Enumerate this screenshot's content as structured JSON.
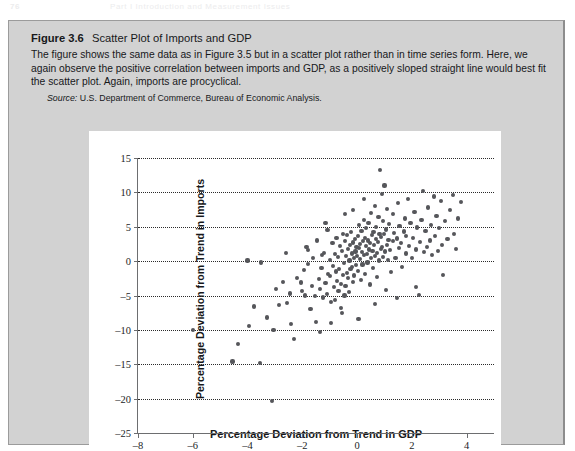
{
  "page_header": {
    "folio": "76",
    "running_head": "Part I  Introduction and Measurement Issues"
  },
  "figure": {
    "label": "Figure 3.6",
    "title": "Scatter Plot of Imports and GDP",
    "description": "The figure shows the same data as in Figure 3.5 but in a scatter plot rather than in time series form. Here, we again observe the positive correlation between imports and GDP, as a positively sloped straight line would best fit the scatter plot. Again, imports are procyclical.",
    "source_label": "Source:",
    "source_text": "U.S. Department of Commerce, Bureau of Economic Analysis."
  },
  "colors": {
    "card_background": "#d2d2d2",
    "card_border": "#9b9b9b",
    "plot_background": "#ffffff",
    "marker": "#55565a",
    "axis": "#6d6e70",
    "gridline": "#2b2b2b",
    "text": "#17181a"
  },
  "chart_data": {
    "type": "scatter",
    "title": "Scatter Plot of Imports and GDP",
    "subtitle": "",
    "xlabel": "Percentage Deviation from Trend in GDP",
    "ylabel": "Percentage Deviation from Trend in Imports",
    "xlim": [
      -8,
      5
    ],
    "ylim": [
      -25,
      15
    ],
    "xticks": [
      -8,
      -6,
      -4,
      -2,
      0,
      2,
      4
    ],
    "xtick_labels": [
      "–8",
      "–6",
      "–4",
      "–2",
      "0",
      "2",
      "4"
    ],
    "yticks": [
      15,
      10,
      5,
      0,
      -5,
      -10,
      -15,
      -20,
      -25
    ],
    "ytick_labels": [
      "15",
      "10",
      "5",
      "0",
      "–5",
      "–10",
      "–15",
      "–20",
      "–25"
    ],
    "grid": "horizontal-dotted",
    "legend": null,
    "marker_size": 4,
    "correlation": "positive",
    "points": [
      [
        -6.0,
        -10.0
      ],
      [
        -4.55,
        -14.6
      ],
      [
        -4.35,
        -12.1
      ],
      [
        -3.95,
        -9.4
      ],
      [
        -3.55,
        -14.8
      ],
      [
        -3.5,
        -0.2
      ],
      [
        -3.1,
        -20.4
      ],
      [
        -3.05,
        -10.0
      ],
      [
        -2.85,
        -6.4
      ],
      [
        -2.55,
        -6.1
      ],
      [
        -2.45,
        -4.7
      ],
      [
        -2.4,
        -9.1
      ],
      [
        -2.3,
        -11.3
      ],
      [
        -2.05,
        -3.1
      ],
      [
        -2.0,
        -4.4
      ],
      [
        -1.95,
        -1.3
      ],
      [
        -1.9,
        -5.0
      ],
      [
        -1.85,
        2.1
      ],
      [
        -1.8,
        -0.4
      ],
      [
        -1.78,
        1.6
      ],
      [
        -1.7,
        -7.0
      ],
      [
        -1.65,
        -3.6
      ],
      [
        -1.6,
        0.4
      ],
      [
        -1.55,
        -5.1
      ],
      [
        -1.5,
        -8.8
      ],
      [
        -1.45,
        3.0
      ],
      [
        -1.4,
        -2.6
      ],
      [
        -1.35,
        -4.1
      ],
      [
        -1.3,
        -1.0
      ],
      [
        -1.28,
        0.9
      ],
      [
        -1.25,
        -5.3
      ],
      [
        -1.2,
        1.2
      ],
      [
        -1.15,
        -3.2
      ],
      [
        -1.1,
        -4.8
      ],
      [
        -1.08,
        4.5
      ],
      [
        -1.05,
        -1.9
      ],
      [
        -1.0,
        0.2
      ],
      [
        -0.98,
        -2.2
      ],
      [
        -0.95,
        -6.0
      ],
      [
        -0.9,
        2.6
      ],
      [
        -0.88,
        -0.7
      ],
      [
        -0.85,
        -3.8
      ],
      [
        -0.82,
        1.0
      ],
      [
        -0.8,
        -5.6
      ],
      [
        -0.78,
        -1.5
      ],
      [
        -0.75,
        3.4
      ],
      [
        -0.72,
        -2.9
      ],
      [
        -0.7,
        0.6
      ],
      [
        -0.68,
        -4.3
      ],
      [
        -0.65,
        -1.1
      ],
      [
        -0.62,
        2.2
      ],
      [
        -0.6,
        -3.3
      ],
      [
        -0.58,
        -6.8
      ],
      [
        -0.55,
        1.5
      ],
      [
        -0.52,
        -2.0
      ],
      [
        -0.5,
        4.0
      ],
      [
        -0.48,
        -0.3
      ],
      [
        -0.46,
        -5.0
      ],
      [
        -0.44,
        2.9
      ],
      [
        -0.42,
        -3.6
      ],
      [
        -0.4,
        0.8
      ],
      [
        -0.38,
        -1.7
      ],
      [
        -0.36,
        3.8
      ],
      [
        -0.34,
        -2.4
      ],
      [
        -0.32,
        1.8
      ],
      [
        -0.3,
        -4.5
      ],
      [
        -0.28,
        0.1
      ],
      [
        -0.26,
        2.4
      ],
      [
        -0.24,
        -1.2
      ],
      [
        -0.22,
        4.2
      ],
      [
        -0.2,
        -0.9
      ],
      [
        -0.18,
        1.1
      ],
      [
        -0.16,
        -3.0
      ],
      [
        -0.14,
        2.7
      ],
      [
        -0.12,
        0.4
      ],
      [
        -0.1,
        -2.1
      ],
      [
        -0.08,
        3.2
      ],
      [
        -0.06,
        1.4
      ],
      [
        -0.04,
        -0.6
      ],
      [
        -0.02,
        2.0
      ],
      [
        0.0,
        0.7
      ],
      [
        0.02,
        3.6
      ],
      [
        0.04,
        -1.4
      ],
      [
        0.06,
        1.9
      ],
      [
        0.08,
        5.2
      ],
      [
        0.1,
        0.3
      ],
      [
        0.12,
        2.5
      ],
      [
        0.14,
        -2.8
      ],
      [
        0.16,
        4.4
      ],
      [
        0.18,
        1.3
      ],
      [
        0.2,
        -0.5
      ],
      [
        0.22,
        2.9
      ],
      [
        0.24,
        6.0
      ],
      [
        0.26,
        0.9
      ],
      [
        0.28,
        3.4
      ],
      [
        0.3,
        -1.9
      ],
      [
        0.32,
        2.2
      ],
      [
        0.34,
        4.8
      ],
      [
        0.36,
        1.0
      ],
      [
        0.38,
        -0.2
      ],
      [
        0.4,
        3.0
      ],
      [
        0.42,
        5.5
      ],
      [
        0.44,
        1.7
      ],
      [
        0.46,
        -3.4
      ],
      [
        0.48,
        2.6
      ],
      [
        0.5,
        7.0
      ],
      [
        0.52,
        0.5
      ],
      [
        0.54,
        3.8
      ],
      [
        0.56,
        1.5
      ],
      [
        0.58,
        -1.0
      ],
      [
        0.6,
        4.2
      ],
      [
        0.62,
        2.3
      ],
      [
        0.64,
        8.0
      ],
      [
        0.66,
        0.8
      ],
      [
        0.68,
        3.2
      ],
      [
        0.7,
        5.0
      ],
      [
        0.72,
        1.2
      ],
      [
        0.74,
        -2.3
      ],
      [
        0.76,
        2.8
      ],
      [
        0.78,
        6.4
      ],
      [
        0.8,
        0.1
      ],
      [
        0.82,
        4.0
      ],
      [
        0.84,
        13.2
      ],
      [
        0.86,
        1.8
      ],
      [
        0.88,
        3.5
      ],
      [
        0.9,
        9.8
      ],
      [
        0.92,
        2.1
      ],
      [
        0.94,
        5.8
      ],
      [
        0.96,
        0.6
      ],
      [
        0.98,
        3.9
      ],
      [
        1.0,
        11.0
      ],
      [
        1.02,
        1.4
      ],
      [
        1.05,
        4.6
      ],
      [
        1.08,
        2.4
      ],
      [
        1.1,
        7.6
      ],
      [
        1.12,
        0.2
      ],
      [
        1.15,
        3.1
      ],
      [
        1.18,
        5.4
      ],
      [
        1.2,
        1.6
      ],
      [
        1.25,
        -1.6
      ],
      [
        1.3,
        2.9
      ],
      [
        1.32,
        6.8
      ],
      [
        1.35,
        4.1
      ],
      [
        1.4,
        0.4
      ],
      [
        1.45,
        3.3
      ],
      [
        1.5,
        8.4
      ],
      [
        1.52,
        1.9
      ],
      [
        1.55,
        5.1
      ],
      [
        1.6,
        2.6
      ],
      [
        1.65,
        -0.8
      ],
      [
        1.7,
        4.3
      ],
      [
        1.75,
        6.2
      ],
      [
        1.78,
        1.1
      ],
      [
        1.8,
        3.7
      ],
      [
        1.85,
        9.0
      ],
      [
        1.9,
        2.2
      ],
      [
        1.95,
        5.6
      ],
      [
        2.0,
        0.5
      ],
      [
        2.05,
        3.4
      ],
      [
        2.1,
        7.2
      ],
      [
        2.15,
        1.7
      ],
      [
        2.2,
        4.9
      ],
      [
        2.25,
        -4.9
      ],
      [
        2.3,
        2.8
      ],
      [
        2.35,
        6.0
      ],
      [
        2.4,
        10.2
      ],
      [
        2.45,
        1.3
      ],
      [
        2.5,
        4.4
      ],
      [
        2.55,
        2.0
      ],
      [
        2.6,
        7.8
      ],
      [
        2.65,
        3.0
      ],
      [
        2.7,
        5.2
      ],
      [
        2.75,
        0.9
      ],
      [
        2.8,
        9.4
      ],
      [
        2.85,
        3.6
      ],
      [
        2.9,
        6.6
      ],
      [
        2.95,
        1.5
      ],
      [
        3.0,
        4.8
      ],
      [
        3.05,
        8.8
      ],
      [
        3.1,
        2.4
      ],
      [
        3.2,
        5.8
      ],
      [
        3.3,
        3.2
      ],
      [
        3.4,
        7.4
      ],
      [
        3.5,
        9.6
      ],
      [
        3.55,
        4.0
      ],
      [
        3.6,
        1.8
      ],
      [
        3.7,
        6.2
      ],
      [
        3.8,
        8.6
      ],
      [
        -4.0,
        0.1
      ],
      [
        -2.95,
        -4.0
      ],
      [
        -2.7,
        -3.0
      ],
      [
        -3.3,
        -8.2
      ],
      [
        -2.2,
        -2.5
      ],
      [
        -1.35,
        -10.3
      ],
      [
        -0.95,
        -9.0
      ],
      [
        -0.55,
        -7.6
      ],
      [
        0.05,
        -8.4
      ],
      [
        0.65,
        -6.2
      ],
      [
        1.45,
        -5.4
      ],
      [
        2.15,
        -3.8
      ],
      [
        3.15,
        -2.0
      ],
      [
        -1.15,
        5.6
      ],
      [
        -0.45,
        6.8
      ],
      [
        0.25,
        9.0
      ],
      [
        -0.15,
        7.4
      ],
      [
        1.05,
        -4.2
      ],
      [
        -2.6,
        1.2
      ],
      [
        -3.75,
        -6.6
      ]
    ]
  }
}
